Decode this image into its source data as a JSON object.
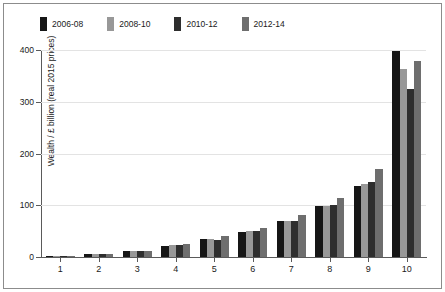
{
  "chart_data": {
    "type": "bar",
    "title": "",
    "xlabel": "",
    "ylabel": "Wealth / £ billion (real 2015 prices)",
    "categories": [
      "1",
      "2",
      "3",
      "4",
      "5",
      "6",
      "7",
      "8",
      "9",
      "10"
    ],
    "ylim": [
      0,
      400
    ],
    "yticks": [
      0,
      100,
      200,
      300,
      400
    ],
    "ytick_labels": [
      "0",
      "100",
      "200",
      "300",
      "400"
    ],
    "grid": true,
    "legend_position": "top-left",
    "series": [
      {
        "name": "2006-08",
        "color": "#161616",
        "values": [
          1,
          6,
          11,
          22,
          34,
          48,
          70,
          99,
          138,
          399
        ]
      },
      {
        "name": "2008-10",
        "color": "#989898",
        "values": [
          1,
          5,
          11,
          23,
          34,
          50,
          70,
          99,
          142,
          364
        ]
      },
      {
        "name": "2010-12",
        "color": "#2e2e2e",
        "values": [
          1,
          5,
          11,
          23,
          33,
          51,
          70,
          100,
          145,
          324
        ]
      },
      {
        "name": "2012-14",
        "color": "#6e6e6e",
        "values": [
          1,
          6,
          12,
          25,
          40,
          57,
          82,
          114,
          171,
          378
        ]
      }
    ]
  },
  "figure": {
    "background": "#ffffff",
    "frame_color": "#8c8c8c",
    "axis_color": "#5a5a5a",
    "grid_color": "#e3e3e3",
    "text_color": "#1a1a1a"
  }
}
